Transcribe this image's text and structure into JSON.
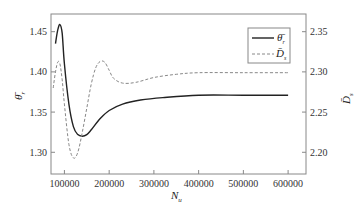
{
  "chart_data": {
    "type": "line",
    "title": "",
    "xlabel": "N_u",
    "ylabel_left": "θ̄_r",
    "ylabel_right": "D̄_s",
    "xlim": [
      70000,
      640000
    ],
    "ylim_left": [
      1.273,
      1.472
    ],
    "ylim_right": [
      2.173,
      2.372
    ],
    "x_ticks": [
      100000,
      200000,
      300000,
      400000,
      500000,
      600000
    ],
    "x_tick_labels": [
      "100000",
      "200000",
      "300000",
      "400000",
      "500000",
      "600000"
    ],
    "y_left_ticks": [
      1.3,
      1.35,
      1.4,
      1.45
    ],
    "y_left_tick_labels": [
      "1.30",
      "1.35",
      "1.40",
      "1.45"
    ],
    "y_right_ticks": [
      2.2,
      2.25,
      2.3,
      2.35
    ],
    "y_right_tick_labels": [
      "2.20",
      "2.25",
      "2.30",
      "2.35"
    ],
    "grid": false,
    "legend_position": "upper right",
    "series": [
      {
        "name": "θ̄_r",
        "axis": "left",
        "style": "solid",
        "color": "#222222",
        "x": [
          80000,
          85000,
          90000,
          95000,
          100000,
          110000,
          120000,
          130000,
          140000,
          150000,
          160000,
          180000,
          200000,
          230000,
          270000,
          320000,
          400000,
          500000,
          600000
        ],
        "y": [
          1.435,
          1.452,
          1.459,
          1.448,
          1.41,
          1.36,
          1.332,
          1.322,
          1.32,
          1.322,
          1.328,
          1.342,
          1.352,
          1.36,
          1.365,
          1.368,
          1.371,
          1.371,
          1.371
        ]
      },
      {
        "name": "D̄_s",
        "axis": "right",
        "style": "dashed",
        "color": "#888888",
        "x": [
          75000,
          80000,
          85000,
          90000,
          95000,
          100000,
          110000,
          120000,
          130000,
          140000,
          150000,
          160000,
          170000,
          180000,
          190000,
          200000,
          210000,
          230000,
          260000,
          300000,
          350000,
          400000,
          500000,
          600000
        ],
        "y": [
          2.28,
          2.3,
          2.312,
          2.31,
          2.29,
          2.26,
          2.21,
          2.193,
          2.2,
          2.225,
          2.255,
          2.285,
          2.305,
          2.313,
          2.312,
          2.302,
          2.292,
          2.286,
          2.287,
          2.293,
          2.297,
          2.299,
          2.299,
          2.299
        ]
      }
    ]
  },
  "legend": {
    "items": [
      {
        "label": "θ̄",
        "sub": "r",
        "style": "solid"
      },
      {
        "label": "D̄",
        "sub": "s",
        "style": "dashed"
      }
    ]
  },
  "axes": {
    "xlabel_main": "N",
    "xlabel_sub": "u",
    "ylabel_left_main": "θ̄",
    "ylabel_left_sub": "r",
    "ylabel_right_main": "D̄",
    "ylabel_right_sub": "s"
  }
}
